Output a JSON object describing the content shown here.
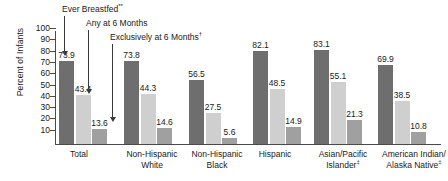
{
  "chart_data": {
    "type": "bar",
    "title": "",
    "xlabel": "",
    "ylabel": "Percent of Infants",
    "ylim": [
      0,
      100
    ],
    "yticks": [
      100,
      90,
      80,
      70,
      60,
      50,
      40,
      30,
      20,
      10
    ],
    "grid": false,
    "legend_position": "annotations-with-arrows",
    "categories": [
      "Total",
      "Non-Hispanic White",
      "Non-Hispanic Black",
      "Hispanic",
      "Asian/Pacific Islander‡",
      "American Indian/ Alaska Native‡"
    ],
    "category_lines": [
      [
        "Total"
      ],
      [
        "Non-Hispanic",
        "White"
      ],
      [
        "Non-Hispanic",
        "Black"
      ],
      [
        "Hispanic"
      ],
      [
        "Asian/Pacific",
        "Islander‡"
      ],
      [
        "American Indian/",
        "Alaska Native‡"
      ]
    ],
    "series": [
      {
        "name": "Ever Breastfed**",
        "color": "#6e6e6e",
        "values": [
          73.9,
          73.8,
          56.5,
          82.1,
          83.1,
          69.9
        ]
      },
      {
        "name": "Any at 6 Months",
        "color": "#cfcfcf",
        "values": [
          43.4,
          44.3,
          27.5,
          48.5,
          55.1,
          38.5
        ]
      },
      {
        "name": "Exclusively at 6 Months†",
        "color": "#a0a0a0",
        "values": [
          13.6,
          14.6,
          5.6,
          14.9,
          21.3,
          10.8
        ]
      }
    ],
    "annotations": [
      {
        "text": "Ever Breastfed**",
        "points_to": "series-0-bar-0"
      },
      {
        "text": "Any at 6 Months",
        "points_to": "series-1-bar-0"
      },
      {
        "text": "Exclusively at 6 Months†",
        "points_to": "series-2-bar-0"
      }
    ]
  }
}
